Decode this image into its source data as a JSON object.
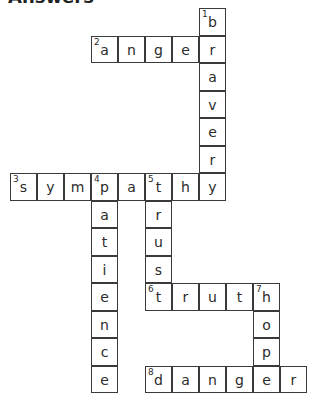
{
  "title": "Answers",
  "grid": {
    "origin_x": 10,
    "origin_y": 8,
    "cell_w": 27,
    "cell_h": 27.5
  },
  "words": [
    {
      "number": "1",
      "answer": "braver",
      "direction": "down",
      "row": 0,
      "col": 7
    },
    {
      "number": "2",
      "answer": "anger",
      "direction": "across",
      "row": 1,
      "col": 3
    },
    {
      "number": "3",
      "answer": "sympathy",
      "direction": "across",
      "row": 6,
      "col": 0
    },
    {
      "number": "4",
      "answer": "patience",
      "direction": "down",
      "row": 6,
      "col": 3
    },
    {
      "number": "5",
      "answer": "trust",
      "direction": "down",
      "row": 6,
      "col": 5
    },
    {
      "number": "6",
      "answer": "truth",
      "direction": "across",
      "row": 10,
      "col": 5
    },
    {
      "number": "7",
      "answer": "hope",
      "direction": "down",
      "row": 10,
      "col": 9
    },
    {
      "number": "8",
      "answer": "danger",
      "direction": "across",
      "row": 13,
      "col": 5
    }
  ]
}
